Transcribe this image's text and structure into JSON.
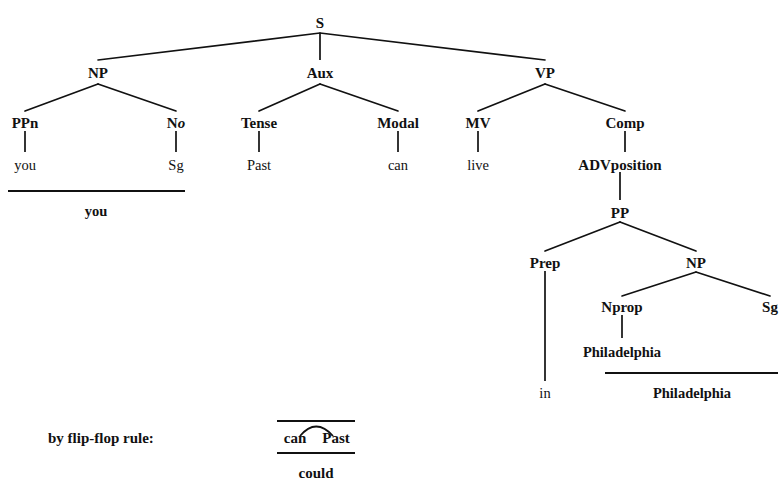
{
  "diagram": {
    "kind": "syntax-tree",
    "sentence_derived": "you could live in Philadelphia",
    "ink_color": "#111111",
    "background_color": "#ffffff"
  },
  "nodes": {
    "s": "S",
    "np_subject": "NP",
    "aux": "Aux",
    "vp": "VP",
    "ppn": "PPn",
    "no_head": "N",
    "no_sub": "o",
    "tense": "Tense",
    "modal": "Modal",
    "mv": "MV",
    "comp": "Comp",
    "advposition": "ADVposition",
    "pp": "PP",
    "prep": "Prep",
    "np_object": "NP",
    "nprop": "Nprop",
    "sg_object": "Sg"
  },
  "leaves": {
    "you": "you",
    "sg": "Sg",
    "past": "Past",
    "can": "can",
    "live": "live",
    "philadelphia": "Philadelphia",
    "in": "in"
  },
  "derived": {
    "you": "you",
    "philadelphia": "Philadelphia",
    "could": "could"
  },
  "rule": {
    "label": "by flip-flop rule:",
    "left_token": "can",
    "right_token": "Past",
    "result": "could"
  }
}
